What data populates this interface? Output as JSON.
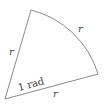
{
  "diagram": {
    "colors": {
      "stroke": "#8a8a8a",
      "text": "#3a3a3a",
      "background": "#ffffff"
    },
    "vertices": {
      "center": {
        "x": 5,
        "y": 99
      },
      "top": {
        "x": 31,
        "y": 10
      },
      "right": {
        "x": 98,
        "y": 74
      }
    },
    "labels": {
      "left_side": "r",
      "arc": "r",
      "bottom_side": "r",
      "angle": "1 rad"
    }
  }
}
